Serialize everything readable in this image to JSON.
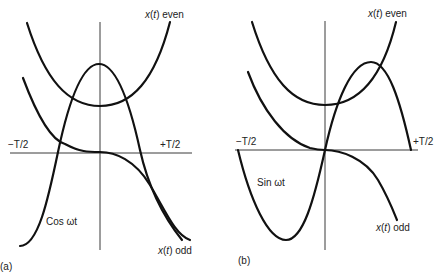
{
  "figure": {
    "panels": [
      {
        "id": "a",
        "caption": "(a)",
        "labels": {
          "even": "x(t) even",
          "odd": "x(t) odd",
          "minus_half_period": "−T/2",
          "plus_half_period": "+T/2",
          "basis": "Cos ωt"
        }
      },
      {
        "id": "b",
        "caption": "(b)",
        "labels": {
          "even": "x(t) even",
          "odd": "x(t) odd",
          "minus_half_period": "−T/2",
          "plus_half_period": "+T/2",
          "basis": "Sin ωt"
        }
      }
    ]
  }
}
